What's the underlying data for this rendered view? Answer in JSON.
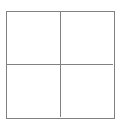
{
  "figure": {
    "name": "2x2 grid of empty squares",
    "background_color": "#ffffff",
    "line_color": "#808080",
    "line_width_px": 1,
    "outer_square": {
      "x": 6,
      "y": 11,
      "width": 109,
      "height": 108
    },
    "dividers": {
      "vertical_x": 61,
      "horizontal_y": 65
    },
    "rows": 2,
    "columns": 2,
    "cells": [
      {
        "id": "cell-top-left",
        "label": "",
        "fill": "#ffffff"
      },
      {
        "id": "cell-top-right",
        "label": "",
        "fill": "#ffffff"
      },
      {
        "id": "cell-bottom-left",
        "label": "",
        "fill": "#ffffff"
      },
      {
        "id": "cell-bottom-right",
        "label": "",
        "fill": "#ffffff"
      }
    ]
  }
}
